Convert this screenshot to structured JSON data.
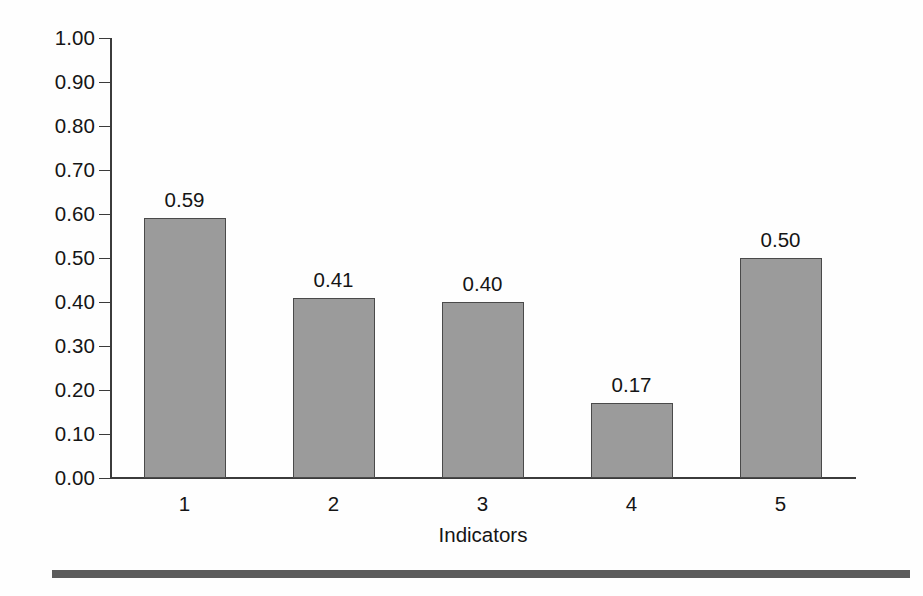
{
  "chart_data": {
    "type": "bar",
    "title": "",
    "subtitle": "",
    "xlabel": "Indicators",
    "ylabel": "",
    "categories": [
      "1",
      "2",
      "3",
      "4",
      "5"
    ],
    "values": [
      0.59,
      0.41,
      0.4,
      0.17,
      0.5
    ],
    "data_labels": [
      "0.59",
      "0.41",
      "0.40",
      "0.17",
      "0.50"
    ],
    "ylim": [
      0.0,
      1.0
    ],
    "ytick_values": [
      1.0,
      0.9,
      0.8,
      0.7,
      0.6,
      0.5,
      0.4,
      0.3,
      0.2,
      0.1,
      0.0
    ],
    "ytick_labels": [
      "1.00",
      "0.90",
      "0.80",
      "0.70",
      "0.60",
      "0.50",
      "0.40",
      "0.30",
      "0.20",
      "0.10",
      "0.00"
    ],
    "grid": false,
    "legend": null,
    "series": [
      {
        "name": "Indicators",
        "values": [
          0.59,
          0.41,
          0.4,
          0.17,
          0.5
        ]
      }
    ],
    "colors": {
      "bar_fill": "#9b9b9b",
      "bar_border": "#4a4a4a",
      "axis": "#3b3b3b",
      "text": "#151515",
      "background": "#fefefe",
      "bottom_rule": "#5c5c5c"
    }
  },
  "axes": {
    "x_title": "Indicators",
    "x_tick_labels": [
      "1",
      "2",
      "3",
      "4",
      "5"
    ],
    "y_tick_labels": [
      "1.00",
      "0.90",
      "0.80",
      "0.70",
      "0.60",
      "0.50",
      "0.40",
      "0.30",
      "0.20",
      "0.10",
      "0.00"
    ]
  },
  "bars": [
    {
      "category": "1",
      "value": 0.59,
      "label": "0.59"
    },
    {
      "category": "2",
      "value": 0.41,
      "label": "0.41"
    },
    {
      "category": "3",
      "value": 0.4,
      "label": "0.40"
    },
    {
      "category": "4",
      "value": 0.17,
      "label": "0.17"
    },
    {
      "category": "5",
      "value": 0.5,
      "label": "0.50"
    }
  ]
}
